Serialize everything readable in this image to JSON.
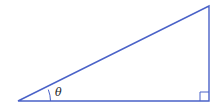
{
  "diagram": {
    "type": "right-triangle",
    "stroke_color": "#4a62c8",
    "angle_label": "θ",
    "vertices": {
      "bottom_left": [
        18,
        101
      ],
      "bottom_right": [
        209,
        101
      ],
      "top_right": [
        209,
        6
      ]
    },
    "right_angle_marker": "bottom-right"
  }
}
